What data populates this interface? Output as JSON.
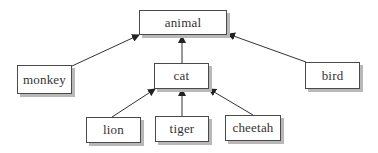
{
  "diagram": {
    "type": "hierarchy-tree",
    "nodes": [
      {
        "id": "animal",
        "label": "animal"
      },
      {
        "id": "monkey",
        "label": "monkey"
      },
      {
        "id": "cat",
        "label": "cat"
      },
      {
        "id": "bird",
        "label": "bird"
      },
      {
        "id": "lion",
        "label": "lion"
      },
      {
        "id": "tiger",
        "label": "tiger"
      },
      {
        "id": "cheetah",
        "label": "cheetah"
      }
    ],
    "edges": [
      {
        "from": "monkey",
        "to": "animal"
      },
      {
        "from": "cat",
        "to": "animal"
      },
      {
        "from": "bird",
        "to": "animal"
      },
      {
        "from": "lion",
        "to": "cat"
      },
      {
        "from": "tiger",
        "to": "cat"
      },
      {
        "from": "cheetah",
        "to": "cat"
      }
    ]
  }
}
